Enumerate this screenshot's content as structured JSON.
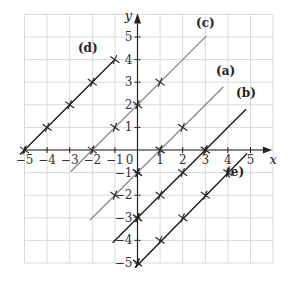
{
  "chart_data": {
    "type": "line",
    "title": "",
    "xlabel": "x",
    "ylabel": "y",
    "xlim": [
      -5,
      6
    ],
    "ylim": [
      -5,
      6
    ],
    "grid": true,
    "xticks": [
      -5,
      -4,
      -3,
      -2,
      -1,
      0,
      1,
      2,
      3,
      4,
      5
    ],
    "yticks": [
      -5,
      -4,
      -3,
      -2,
      -1,
      1,
      2,
      3,
      4,
      5
    ],
    "x_tick_labels": [
      "−5",
      "−4",
      "−3",
      "−2",
      "−1",
      "0",
      "1",
      "2",
      "3",
      "4",
      "5"
    ],
    "y_tick_labels": [
      "−5",
      "−4",
      "−3",
      "−2",
      "−1",
      "1",
      "2",
      "3",
      "4",
      "5"
    ],
    "series": [
      {
        "name": "(a)",
        "equation": "y = x − 1",
        "color": "#8c8c8c",
        "x": [
          -2.1,
          3.8
        ],
        "y": [
          -3.1,
          2.8
        ],
        "markers": [
          [
            -1,
            -2
          ],
          [
            0,
            -1
          ],
          [
            1,
            0
          ],
          [
            2,
            1
          ]
        ],
        "label_pos": [
          3.9,
          3.3
        ]
      },
      {
        "name": "(b)",
        "equation": "y = x − 3",
        "color": "#1a1a1a",
        "x": [
          -1.1,
          4.8
        ],
        "y": [
          -4.1,
          1.8
        ],
        "markers": [
          [
            0,
            -3
          ],
          [
            1,
            -2
          ],
          [
            2,
            -1
          ],
          [
            3,
            0
          ]
        ],
        "label_pos": [
          4.8,
          2.35
        ]
      },
      {
        "name": "(c)",
        "equation": "y = x + 2",
        "color": "#8c8c8c",
        "x": [
          -2.95,
          3.05
        ],
        "y": [
          -0.95,
          5.05
        ],
        "markers": [
          [
            -1,
            1
          ],
          [
            0,
            2
          ],
          [
            1,
            3
          ]
        ],
        "label_pos": [
          3.0,
          5.45
        ]
      },
      {
        "name": "(d)",
        "equation": "y = x + 5",
        "color": "#1a1a1a",
        "x": [
          -5.2,
          -1.0
        ],
        "y": [
          -0.2,
          4.0
        ],
        "markers": [
          [
            -5,
            0
          ],
          [
            -4,
            1
          ],
          [
            -3,
            2
          ],
          [
            -2,
            3
          ],
          [
            -1,
            4
          ]
        ],
        "label_pos": [
          -2.2,
          4.35
        ]
      },
      {
        "name": "(e)",
        "equation": "y = x − 5",
        "color": "#1a1a1a",
        "x": [
          -0.1,
          4.85
        ],
        "y": [
          -5.2,
          -0.15
        ],
        "markers": [
          [
            0,
            -5
          ],
          [
            1,
            -4
          ],
          [
            2,
            -3
          ],
          [
            3,
            -2
          ],
          [
            4,
            -1
          ]
        ],
        "label_pos": [
          4.3,
          -1.15
        ]
      }
    ],
    "extra_markers": [
      [
        -2,
        0
      ],
      [
        1,
        0
      ],
      [
        3,
        0
      ],
      [
        0,
        -1
      ],
      [
        0,
        -3
      ],
      [
        0,
        -5
      ]
    ],
    "legend": "none"
  }
}
